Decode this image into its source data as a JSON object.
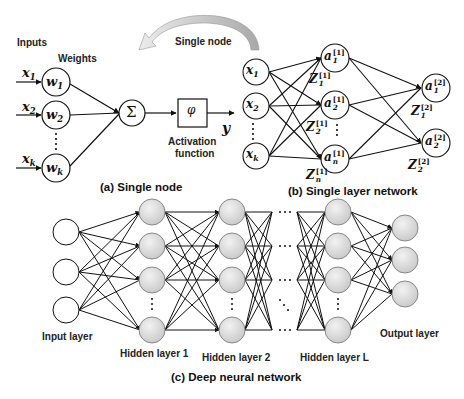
{
  "panel_a": {
    "inputs_label": "Inputs",
    "weights_label": "Weights",
    "inputs": [
      {
        "var": "x",
        "sub": "1"
      },
      {
        "var": "x",
        "sub": "2"
      },
      {
        "var": "x",
        "sub": "k"
      }
    ],
    "weights": [
      {
        "var": "w",
        "sub": "1"
      },
      {
        "var": "w",
        "sub": "2"
      },
      {
        "var": "w",
        "sub": "k"
      }
    ],
    "sum_symbol": "Σ",
    "activation_symbol": "φ",
    "activation_label_line1": "Activation",
    "activation_label_line2": "function",
    "output": "y",
    "caption": "(a) Single node"
  },
  "curved_arrow": {
    "label": "Single node",
    "color": "#b8b8b8"
  },
  "panel_b": {
    "inputs": [
      {
        "var": "x",
        "sub": "1"
      },
      {
        "var": "x",
        "sub": "2"
      },
      {
        "var": "x",
        "sub": "k"
      }
    ],
    "hidden": [
      {
        "var": "a",
        "sup": "[1]",
        "sub": "1"
      },
      {
        "var": "a",
        "sup": "[1]",
        "sub": "2"
      },
      {
        "var": "a",
        "sup": "[1]",
        "sub": "n"
      }
    ],
    "hidden_z": [
      {
        "var": "Z",
        "sup": "[1]",
        "sub": "1"
      },
      {
        "var": "Z",
        "sup": "[1]",
        "sub": "2"
      },
      {
        "var": "Z",
        "sup": "[1]",
        "sub": "n"
      }
    ],
    "outputs": [
      {
        "var": "a",
        "sup": "[2]",
        "sub": "1"
      },
      {
        "var": "a",
        "sup": "[2]",
        "sub": "2"
      }
    ],
    "output_z": [
      {
        "var": "Z",
        "sup": "[2]",
        "sub": "1"
      },
      {
        "var": "Z",
        "sup": "[2]",
        "sub": "2"
      }
    ],
    "caption": "(b) Single layer network"
  },
  "panel_c": {
    "input_layer_label": "Input layer",
    "hidden_layer_1_label": "Hidden layer 1",
    "hidden_layer_2_label": "Hidden layer 2",
    "hidden_layer_L_label": "Hidden layer L",
    "output_layer_label": "Output layer",
    "caption": "(c) Deep neural network",
    "node_fill": "#d9d9d9"
  }
}
